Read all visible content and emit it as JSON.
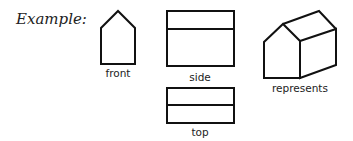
{
  "title": "Example:",
  "views": [
    {
      "id": "front",
      "label": "front"
    },
    {
      "id": "side",
      "label": "side"
    },
    {
      "id": "top",
      "label": "top"
    },
    {
      "id": "isometric",
      "label": "represents"
    }
  ],
  "colors": {
    "stroke": "#111111",
    "background": "#ffffff"
  }
}
